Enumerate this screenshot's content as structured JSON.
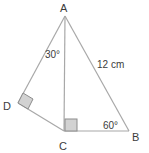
{
  "diagram": {
    "type": "geometry-triangles",
    "vertices": {
      "A": {
        "label": "A"
      },
      "B": {
        "label": "B"
      },
      "C": {
        "label": "C"
      },
      "D": {
        "label": "D"
      }
    },
    "angles": {
      "at_A_between_AD_AC": "30°",
      "at_B": "60°"
    },
    "lengths": {
      "AB": "12 cm"
    },
    "right_angles": [
      "D",
      "C"
    ],
    "colors": {
      "line": "#a8a8a8",
      "right_angle_fill": "#d2d2d2",
      "text": "#3c3c3c"
    }
  }
}
